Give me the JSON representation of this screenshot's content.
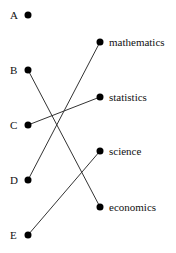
{
  "left_nodes": [
    {
      "label": "A",
      "x": 28,
      "y": 15
    },
    {
      "label": "B",
      "x": 28,
      "y": 70
    },
    {
      "label": "C",
      "x": 28,
      "y": 125
    },
    {
      "label": "D",
      "x": 28,
      "y": 180
    },
    {
      "label": "E",
      "x": 28,
      "y": 235
    }
  ],
  "right_nodes": [
    {
      "label": "mathematics",
      "x": 100,
      "y": 42
    },
    {
      "label": "statistics",
      "x": 100,
      "y": 97
    },
    {
      "label": "science",
      "x": 100,
      "y": 151
    },
    {
      "label": "economics",
      "x": 100,
      "y": 207
    }
  ],
  "connections": [
    {
      "from": "B",
      "to": "economics"
    },
    {
      "from": "C",
      "to": "statistics"
    },
    {
      "from": "D",
      "to": "mathematics"
    },
    {
      "from": "E",
      "to": "science"
    }
  ],
  "colors": {
    "line": "#333333",
    "dot": "#000000"
  }
}
